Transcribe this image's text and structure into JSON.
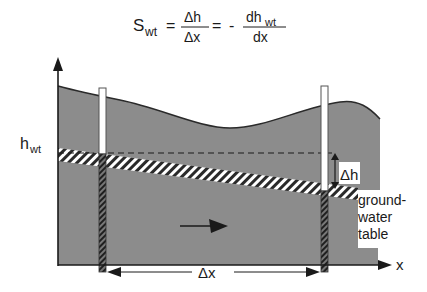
{
  "equation": {
    "lhs": "S",
    "lhs_sub": "wt",
    "eq1": "=",
    "frac1_num": "Δh",
    "frac1_den": "Δx",
    "eq2": "=",
    "minus": "-",
    "frac2_num": "dh",
    "frac2_num_sub": "wt",
    "frac2_den": "dx"
  },
  "labels": {
    "hwt": "h",
    "hwt_sub": "wt",
    "delta_h": "Δh",
    "groundwater_line1": "ground-",
    "groundwater_line2": "water",
    "groundwater_line3": "table",
    "delta_x": "Δx",
    "x_axis": "x"
  },
  "colors": {
    "ground_fill": "#8c8c8c",
    "ink": "#1a1a1a",
    "background": "#ffffff"
  },
  "icons": {
    "flow_arrow": "arrow-right-icon"
  }
}
